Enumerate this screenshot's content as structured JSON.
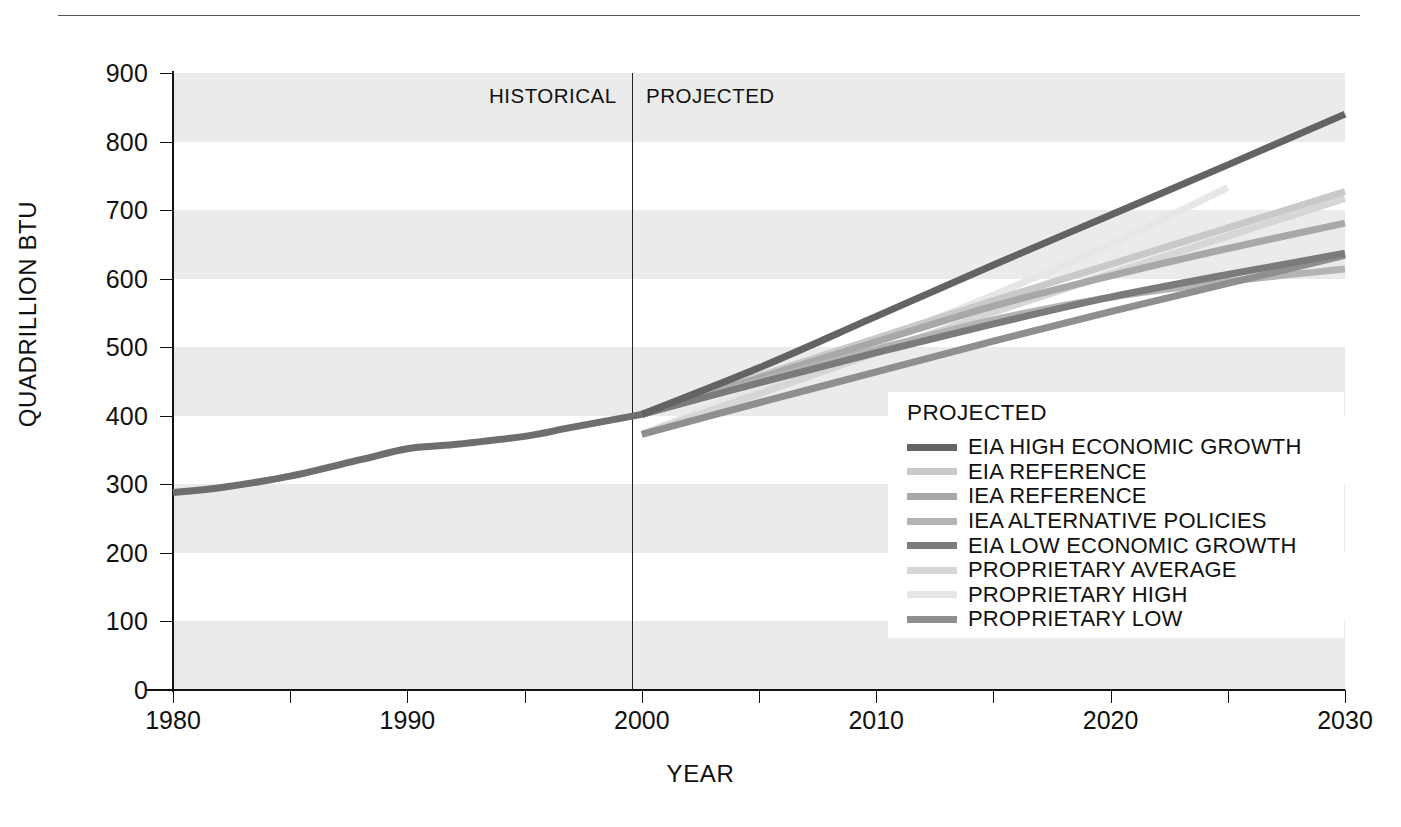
{
  "chart_data": {
    "type": "line",
    "title": "",
    "xlabel": "YEAR",
    "ylabel": "QUADRILLION BTU",
    "xlim": [
      1980,
      2030
    ],
    "ylim": [
      0,
      900
    ],
    "xticks": [
      1980,
      1990,
      2000,
      2010,
      2020,
      2030
    ],
    "xtick_labels": [
      "1980",
      "1990",
      "2000",
      "2010",
      "2020",
      "2030"
    ],
    "xminor_step": 5,
    "yticks": [
      0,
      100,
      200,
      300,
      400,
      500,
      600,
      700,
      800,
      900
    ],
    "ytick_labels": [
      "0",
      "100",
      "200",
      "300",
      "400",
      "500",
      "600",
      "700",
      "800",
      "900"
    ],
    "grid": false,
    "banded_background": true,
    "band_color": "#ebebeb",
    "legend_position": "inside-lower-right",
    "legend_title": "PROJECTED",
    "annotations": [
      {
        "text": "HISTORICAL",
        "x": 1995
      },
      {
        "text": "PROJECTED",
        "x": 2005
      }
    ],
    "divider_x": 2000,
    "historical": {
      "name": "HISTORICAL",
      "color": "#6e6e6e",
      "x": [
        1980,
        1982,
        1985,
        1988,
        1990,
        1992,
        1995,
        1997,
        2000
      ],
      "values": [
        288,
        295,
        312,
        336,
        352,
        358,
        370,
        383,
        402
      ]
    },
    "series": [
      {
        "name": "EIA HIGH ECONOMIC GROWTH",
        "color": "#636363",
        "x": [
          2000,
          2005,
          2010,
          2015,
          2020,
          2025,
          2030
        ],
        "values": [
          402,
          470,
          545,
          620,
          693,
          766,
          840
        ]
      },
      {
        "name": "EIA REFERENCE",
        "color": "#c9c9c9",
        "x": [
          2000,
          2005,
          2010,
          2015,
          2020,
          2025,
          2030
        ],
        "values": [
          402,
          458,
          513,
          568,
          621,
          674,
          727
        ]
      },
      {
        "name": "IEA REFERENCE",
        "color": "#a8a8a8",
        "x": [
          2000,
          2005,
          2010,
          2015,
          2020,
          2025,
          2030
        ],
        "values": [
          402,
          455,
          508,
          560,
          604,
          644,
          681
        ]
      },
      {
        "name": "IEA ALTERNATIVE POLICIES",
        "color": "#b4b4b4",
        "x": [
          2000,
          2005,
          2010,
          2015,
          2020,
          2025,
          2030
        ],
        "values": [
          402,
          450,
          497,
          540,
          573,
          596,
          614
        ]
      },
      {
        "name": "EIA LOW ECONOMIC GROWTH",
        "color": "#7b7b7b",
        "x": [
          2000,
          2005,
          2010,
          2015,
          2020,
          2025,
          2030
        ],
        "values": [
          402,
          448,
          492,
          534,
          573,
          606,
          637
        ]
      },
      {
        "name": "PROPRIETARY AVERAGE",
        "color": "#d6d6d6",
        "x": [
          2000,
          2005,
          2010,
          2015,
          2020,
          2025,
          2030
        ],
        "values": [
          373,
          432,
          492,
          551,
          607,
          662,
          717
        ]
      },
      {
        "name": "PROPRIETARY HIGH",
        "color": "#e6e6e6",
        "x": [
          2000,
          2005,
          2010,
          2015,
          2020,
          2025
        ],
        "values": [
          373,
          440,
          508,
          576,
          650,
          733
        ]
      },
      {
        "name": "PROPRIETARY LOW",
        "color": "#8f8f8f",
        "x": [
          2000,
          2005,
          2010,
          2015,
          2020,
          2025,
          2030
        ],
        "values": [
          373,
          419,
          464,
          509,
          552,
          593,
          634
        ]
      }
    ]
  },
  "legend": {
    "title": "PROJECTED",
    "items": [
      {
        "label": "EIA HIGH ECONOMIC GROWTH",
        "color": "#636363"
      },
      {
        "label": "EIA REFERENCE",
        "color": "#c9c9c9"
      },
      {
        "label": "IEA REFERENCE",
        "color": "#a8a8a8"
      },
      {
        "label": "IEA ALTERNATIVE POLICIES",
        "color": "#b4b4b4"
      },
      {
        "label": "EIA LOW ECONOMIC GROWTH",
        "color": "#7b7b7b"
      },
      {
        "label": "PROPRIETARY AVERAGE",
        "color": "#d6d6d6"
      },
      {
        "label": "PROPRIETARY HIGH",
        "color": "#e6e6e6"
      },
      {
        "label": "PROPRIETARY LOW",
        "color": "#8f8f8f"
      }
    ]
  },
  "eras": {
    "historical": "HISTORICAL",
    "projected": "PROJECTED"
  }
}
